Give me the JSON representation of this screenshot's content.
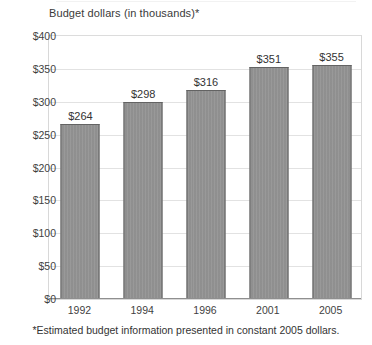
{
  "chart_data": {
    "type": "bar",
    "title": "Budget dollars (in thousands)*",
    "xlabel": "",
    "ylabel": "",
    "categories": [
      "1992",
      "1994",
      "1996",
      "2001",
      "2005"
    ],
    "values": [
      264,
      298,
      316,
      351,
      355
    ],
    "value_labels": [
      "$264",
      "$298",
      "$316",
      "$351",
      "$355"
    ],
    "ylim": [
      0,
      400
    ],
    "ytick_values": [
      0,
      50,
      100,
      150,
      200,
      250,
      300,
      350,
      400
    ],
    "ytick_labels": [
      "$0",
      "$50",
      "$100",
      "$150",
      "$200",
      "$250",
      "$300",
      "$350",
      "$400"
    ],
    "grid": true,
    "legend": "none",
    "annotations": [
      "*Estimated budget information presented in constant 2005 dollars."
    ],
    "colors": {
      "bar_fill": "#949494",
      "bar_border": "#636363",
      "gridline": "#e2e2e2",
      "plot_border": "#d8d8d8",
      "background": "#ffffff",
      "text": "#333333"
    }
  },
  "footnote": {
    "text": "*Estimated budget information presented in constant 2005 dollars."
  }
}
